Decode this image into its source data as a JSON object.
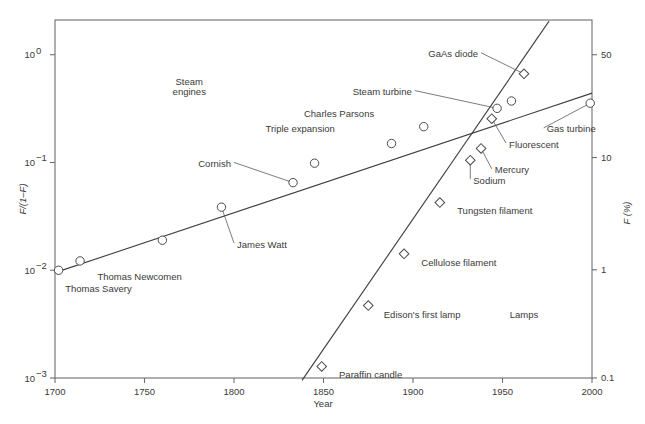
{
  "chart_data": {
    "type": "scatter",
    "title": "",
    "xlabel": "Year",
    "ylabel": "F/(1–F)",
    "ylabel_right": "F (%)",
    "xlim": [
      1700,
      2000
    ],
    "ylim": [
      0.001,
      2.1
    ],
    "yscale": "log",
    "grid": false,
    "legend": null,
    "xticks": [
      1700,
      1750,
      1800,
      1850,
      1900,
      1950,
      2000
    ],
    "xtick_labels": [
      "1700",
      "1750",
      "1800",
      "1850",
      "1900",
      "1950",
      "2000"
    ],
    "yticks": [
      1,
      0.1,
      0.01,
      0.001
    ],
    "ytick_labels": [
      "10⁰",
      "10⁻¹",
      "10⁻²",
      "10⁻³"
    ],
    "yticks_right": [
      50,
      10,
      1,
      0.1
    ],
    "ytick_labels_right": [
      "50",
      "10",
      "1",
      "0.1"
    ],
    "group_annotations": [
      {
        "text": "Steam",
        "x": 1775,
        "y": 0.52
      },
      {
        "text": "engines",
        "x": 1775,
        "y": 0.42
      },
      {
        "text": "Lamps",
        "x": 1962,
        "y": 0.0036
      }
    ],
    "series": [
      {
        "name": "Steam engines",
        "marker": "circle",
        "trendline": {
          "x1": 1700,
          "y1": 0.0095,
          "x2": 2000,
          "y2": 0.44
        },
        "points": [
          {
            "label": "Thomas Savery",
            "x": 1702,
            "y": 0.01,
            "lx": 1704,
            "ly": 0.0068,
            "anchor": "start",
            "leader": false
          },
          {
            "label": "Thomas Newcomen",
            "x": 1714,
            "y": 0.0122,
            "lx": 1722,
            "ly": 0.0087,
            "anchor": "start",
            "leader": false
          },
          {
            "label": "",
            "x": 1760,
            "y": 0.019,
            "lx": 1766,
            "ly": 0.016,
            "anchor": "start",
            "leader": false
          },
          {
            "label": "James Watt",
            "x": 1793,
            "y": 0.0385,
            "lx": 1800,
            "ly": 0.0175,
            "anchor": "start",
            "leader": true
          },
          {
            "label": "Cornish",
            "x": 1833,
            "y": 0.065,
            "lx": 1800,
            "ly": 0.098,
            "anchor": "end",
            "leader": true
          },
          {
            "label": "",
            "x": 1845,
            "y": 0.0985,
            "lx": 1845,
            "ly": 0.0985,
            "anchor": "start",
            "leader": true
          },
          {
            "label": "Triple expansion",
            "x": 1888,
            "y": 0.15,
            "lx": 1858,
            "ly": 0.205,
            "anchor": "end",
            "leader": false
          },
          {
            "label": "Charles Parsons",
            "x": 1906,
            "y": 0.215,
            "lx": 1880,
            "ly": 0.285,
            "anchor": "end",
            "leader": false
          },
          {
            "label": "Steam turbine",
            "x": 1947,
            "y": 0.318,
            "lx": 1901,
            "ly": 0.455,
            "anchor": "end",
            "leader": true
          },
          {
            "label": "",
            "x": 1955,
            "y": 0.372,
            "lx": 1955,
            "ly": 0.372,
            "anchor": "start",
            "leader": true
          },
          {
            "label": "Gas turbine",
            "x": 1999,
            "y": 0.355,
            "lx": 1973,
            "ly": 0.205,
            "anchor": "start",
            "leader": true
          }
        ]
      },
      {
        "name": "Lamps",
        "marker": "diamond",
        "trendline": {
          "x1": 1838,
          "y1": 0.00095,
          "x2": 1976,
          "y2": 2.05
        },
        "points": [
          {
            "label": "Paraffin candle",
            "x": 1849,
            "y": 0.00128,
            "lx": 1857,
            "ly": 0.00108,
            "anchor": "start",
            "leader": false
          },
          {
            "label": "Edison's first lamp",
            "x": 1875,
            "y": 0.0047,
            "lx": 1882,
            "ly": 0.0039,
            "anchor": "start",
            "leader": false
          },
          {
            "label": "Cellulose filament",
            "x": 1895,
            "y": 0.0142,
            "lx": 1903,
            "ly": 0.0118,
            "anchor": "start",
            "leader": false
          },
          {
            "label": "Tungsten filament",
            "x": 1915,
            "y": 0.0425,
            "lx": 1923,
            "ly": 0.0355,
            "anchor": "start",
            "leader": false
          },
          {
            "label": "Sodium",
            "x": 1932,
            "y": 0.105,
            "lx": 1932,
            "ly": 0.0685,
            "anchor": "start",
            "leader": true
          },
          {
            "label": "Mercury",
            "x": 1938,
            "y": 0.135,
            "lx": 1944,
            "ly": 0.0855,
            "anchor": "start",
            "leader": true
          },
          {
            "label": "Fluorescent",
            "x": 1944,
            "y": 0.255,
            "lx": 1952,
            "ly": 0.148,
            "anchor": "start",
            "leader": true
          },
          {
            "label": "GaAs diode",
            "x": 1962,
            "y": 0.665,
            "lx": 1938,
            "ly": 1.02,
            "anchor": "end",
            "leader": true
          }
        ]
      }
    ]
  }
}
